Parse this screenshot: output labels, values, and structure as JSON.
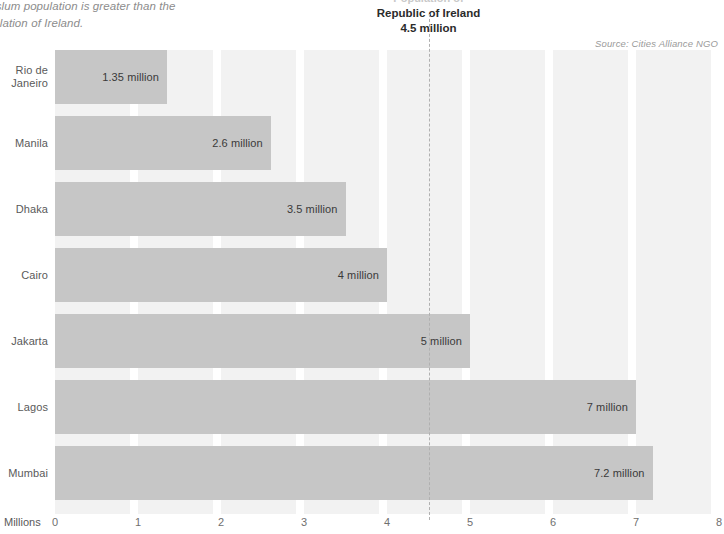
{
  "annotations": {
    "intro_line1": "arta's slum population is greater than the",
    "intro_line2": "e population of Ireland.",
    "ireland_ghost": "Population of",
    "ireland_title": "Republic of Ireland",
    "ireland_value": "4.5 million",
    "source": "Source: Cities Alliance NGO"
  },
  "axis": {
    "y_axis_title": "Millions",
    "x_ticks": [
      "0",
      "1",
      "2",
      "3",
      "4",
      "5",
      "6",
      "7",
      "8"
    ]
  },
  "colors": {
    "bar": "#c6c6c6",
    "band": "#f2f2f2",
    "marker_line": "#b0b0b0",
    "label_text": "#5a5a5a"
  },
  "chart_data": {
    "type": "bar",
    "orientation": "horizontal",
    "title": "",
    "subtitle": "",
    "xlabel": "Millions",
    "ylabel": "",
    "xlim": [
      0,
      8
    ],
    "grid": false,
    "legend": "none",
    "categories": [
      "Rio de Janeiro",
      "Manila",
      "Dhaka",
      "Cairo",
      "Jakarta",
      "Lagos",
      "Mumbai"
    ],
    "values": [
      1.35,
      2.6,
      3.5,
      4,
      5,
      7,
      7.2
    ],
    "value_labels": [
      "1.35 million",
      "2.6 million",
      "3.5 million",
      "4 million",
      "5 million",
      "7 million",
      "7.2 million"
    ],
    "category_label_lines": [
      [
        "Rio de",
        "Janeiro"
      ],
      [
        "Manila"
      ],
      [
        "Dhaka"
      ],
      [
        "Cairo"
      ],
      [
        "Jakarta"
      ],
      [
        "Lagos"
      ],
      [
        "Mumbai"
      ]
    ],
    "reference_line": {
      "label": "Republic of Ireland",
      "value": 4.5,
      "value_label": "4.5 million",
      "style": "dashed"
    },
    "annotations": [
      "Source: Cities Alliance NGO"
    ]
  }
}
